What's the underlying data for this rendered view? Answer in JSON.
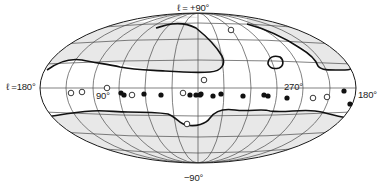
{
  "diagram": {
    "type": "all-sky map (Hammer-Aitoff projection, galactic coordinates)",
    "labels": {
      "top": "ℓ = +90°",
      "left": "ℓ =180°",
      "center_left": "90°",
      "center_right": "270°",
      "right": "180°",
      "bottom": "−90°"
    },
    "colors": {
      "outline": "#1a1a1a",
      "grid": "#4a4a4a",
      "shaded_region": "#e6e6e6",
      "boundary": "#111111",
      "filled_marker": "#111111",
      "open_marker": "#ffffff"
    },
    "markers": {
      "filled": [
        {
          "x": 121,
          "y": 93
        },
        {
          "x": 124,
          "y": 95
        },
        {
          "x": 144,
          "y": 94
        },
        {
          "x": 161,
          "y": 95
        },
        {
          "x": 190,
          "y": 95
        },
        {
          "x": 196,
          "y": 95
        },
        {
          "x": 200,
          "y": 95
        },
        {
          "x": 201,
          "y": 94
        },
        {
          "x": 213,
          "y": 96
        },
        {
          "x": 221,
          "y": 94
        },
        {
          "x": 243,
          "y": 96
        },
        {
          "x": 264,
          "y": 95
        },
        {
          "x": 268,
          "y": 96
        },
        {
          "x": 287,
          "y": 98
        },
        {
          "x": 344,
          "y": 91
        },
        {
          "x": 350,
          "y": 104
        }
      ],
      "open": [
        {
          "x": 71,
          "y": 93
        },
        {
          "x": 82,
          "y": 92
        },
        {
          "x": 107,
          "y": 88
        },
        {
          "x": 132,
          "y": 95
        },
        {
          "x": 183,
          "y": 93
        },
        {
          "x": 204,
          "y": 80
        },
        {
          "x": 187,
          "y": 124
        },
        {
          "x": 231,
          "y": 30
        },
        {
          "x": 313,
          "y": 98
        },
        {
          "x": 327,
          "y": 97
        }
      ]
    }
  }
}
